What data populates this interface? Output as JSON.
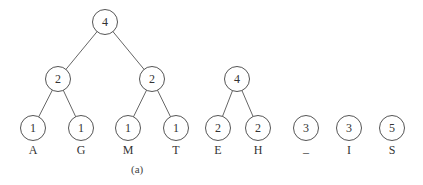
{
  "diagram": {
    "caption": "(a)",
    "nodes": [
      {
        "id": "root",
        "value": "4",
        "x": 105,
        "y": 22
      },
      {
        "id": "l2a",
        "value": "2",
        "x": 58,
        "y": 79
      },
      {
        "id": "l2b",
        "value": "2",
        "x": 152,
        "y": 79
      },
      {
        "id": "A",
        "value": "1",
        "x": 33,
        "y": 128,
        "label": "A"
      },
      {
        "id": "G",
        "value": "1",
        "x": 81,
        "y": 128,
        "label": "G"
      },
      {
        "id": "M",
        "value": "1",
        "x": 128,
        "y": 128,
        "label": "M"
      },
      {
        "id": "T",
        "value": "1",
        "x": 176,
        "y": 128,
        "label": "T"
      },
      {
        "id": "eh",
        "value": "4",
        "x": 237,
        "y": 79
      },
      {
        "id": "E",
        "value": "2",
        "x": 218,
        "y": 128,
        "label": "E"
      },
      {
        "id": "H",
        "value": "2",
        "x": 258,
        "y": 128,
        "label": "H"
      },
      {
        "id": "U",
        "value": "3",
        "x": 306,
        "y": 128,
        "label": "_"
      },
      {
        "id": "I",
        "value": "3",
        "x": 349,
        "y": 128,
        "label": "I"
      },
      {
        "id": "S",
        "value": "5",
        "x": 392,
        "y": 128,
        "label": "S"
      }
    ],
    "edges": [
      [
        "root",
        "l2a"
      ],
      [
        "root",
        "l2b"
      ],
      [
        "l2a",
        "A"
      ],
      [
        "l2a",
        "G"
      ],
      [
        "l2b",
        "M"
      ],
      [
        "l2b",
        "T"
      ],
      [
        "eh",
        "E"
      ],
      [
        "eh",
        "H"
      ]
    ]
  }
}
